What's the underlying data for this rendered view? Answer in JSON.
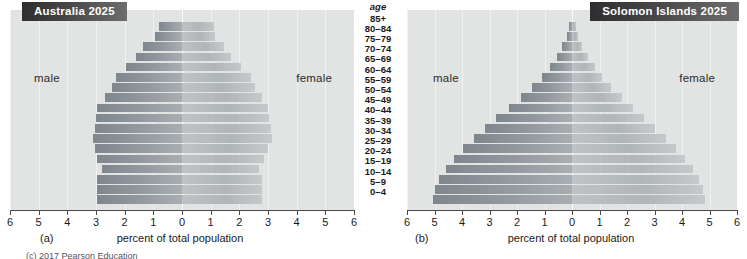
{
  "figure": {
    "age_header": "age",
    "axis_title": "percent of total population",
    "bottom_caption": "(c) 2017 Pearson Education"
  },
  "age_groups": [
    "85+",
    "80–84",
    "75–79",
    "70–74",
    "65–69",
    "60–64",
    "55–59",
    "50–54",
    "45–49",
    "40–44",
    "35–39",
    "30–34",
    "25–29",
    "20–24",
    "15–19",
    "10–14",
    "5–9",
    "0–4"
  ],
  "panels": [
    {
      "letter": "(a)",
      "title": "Australia 2025",
      "male_label": "male",
      "female_label": "female",
      "axis_ticks": [
        "6",
        "5",
        "4",
        "3",
        "2",
        "1",
        "0",
        "1",
        "2",
        "3",
        "4",
        "5",
        "6"
      ]
    },
    {
      "letter": "(b)",
      "title": "Solomon Islands 2025",
      "male_label": "male",
      "female_label": "female",
      "axis_ticks": [
        "6",
        "5",
        "4",
        "3",
        "2",
        "1",
        "0",
        "1",
        "2",
        "3",
        "4",
        "5",
        "6"
      ]
    }
  ],
  "colors": {
    "male_bar": "#8a9197",
    "female_bar": "#b8bcbf",
    "plot_background": "#e2e4e3",
    "badge_dark": "#2e2e2e",
    "axis": "#4a4a4a"
  },
  "chart_data": [
    {
      "type": "bar",
      "title": "Australia 2025",
      "subtitle": "(a)",
      "orientation": "population-pyramid",
      "xlabel": "percent of total population",
      "ylabel": "age",
      "xlim": [
        -6,
        6
      ],
      "xticks": [
        6,
        5,
        4,
        3,
        2,
        1,
        0,
        1,
        2,
        3,
        4,
        5,
        6
      ],
      "grid": true,
      "legend": [
        "male",
        "female"
      ],
      "legend_position": "inside-left-and-right",
      "categories": [
        "85+",
        "80–84",
        "75–79",
        "70–74",
        "65–69",
        "60–64",
        "55–59",
        "50–54",
        "45–49",
        "40–44",
        "35–39",
        "30–34",
        "25–29",
        "20–24",
        "15–19",
        "10–14",
        "5–9",
        "0–4"
      ],
      "series": [
        {
          "name": "male",
          "values": [
            0.8,
            0.95,
            1.35,
            1.6,
            1.95,
            2.3,
            2.45,
            2.7,
            2.95,
            3.0,
            3.05,
            3.1,
            3.05,
            2.95,
            2.8,
            2.95,
            2.95,
            2.95
          ]
        },
        {
          "name": "female",
          "values": [
            1.1,
            1.15,
            1.45,
            1.7,
            2.05,
            2.4,
            2.55,
            2.8,
            3.0,
            3.05,
            3.1,
            3.15,
            3.0,
            2.85,
            2.7,
            2.8,
            2.8,
            2.8
          ]
        }
      ]
    },
    {
      "type": "bar",
      "title": "Solomon Islands 2025",
      "subtitle": "(b)",
      "orientation": "population-pyramid",
      "xlabel": "percent of total population",
      "ylabel": "age",
      "xlim": [
        -6,
        6
      ],
      "xticks": [
        6,
        5,
        4,
        3,
        2,
        1,
        0,
        1,
        2,
        3,
        4,
        5,
        6
      ],
      "grid": true,
      "legend": [
        "male",
        "female"
      ],
      "legend_position": "inside-left-and-right",
      "categories": [
        "85+",
        "80–84",
        "75–79",
        "70–74",
        "65–69",
        "60–64",
        "55–59",
        "50–54",
        "45–49",
        "40–44",
        "35–39",
        "30–34",
        "25–29",
        "20–24",
        "15–19",
        "10–14",
        "5–9",
        "0–4"
      ],
      "series": [
        {
          "name": "male",
          "values": [
            0.12,
            0.2,
            0.35,
            0.55,
            0.8,
            1.1,
            1.45,
            1.85,
            2.3,
            2.75,
            3.15,
            3.55,
            3.95,
            4.3,
            4.6,
            4.85,
            5.0,
            5.05
          ]
        },
        {
          "name": "female",
          "values": [
            0.14,
            0.22,
            0.38,
            0.58,
            0.82,
            1.1,
            1.42,
            1.8,
            2.2,
            2.6,
            3.0,
            3.4,
            3.78,
            4.1,
            4.4,
            4.62,
            4.78,
            4.82
          ]
        }
      ]
    }
  ]
}
